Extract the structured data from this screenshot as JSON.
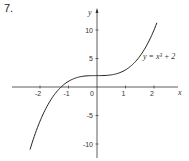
{
  "problem_number": "7.",
  "chart_data": {
    "type": "line",
    "title": "",
    "xlabel": "x",
    "ylabel": "y",
    "xlim": [
      -3.2,
      3.1
    ],
    "ylim": [
      -12.5,
      13.5
    ],
    "x_ticks": [
      -2,
      -1,
      0,
      1,
      2
    ],
    "x_tick_labels": [
      "-2",
      "-1",
      "0",
      "1",
      "2"
    ],
    "y_ticks": [
      10,
      5,
      -5,
      -10
    ],
    "y_tick_labels": [
      "10",
      "5",
      "-5",
      "-10"
    ],
    "grid": false,
    "series": [
      {
        "name": "y = x³ + 2",
        "function": "x^3 + 2",
        "x_range": [
          -2.35,
          2.1
        ],
        "x": [
          -2.35,
          -2,
          -1.5,
          -1.26,
          -1,
          -0.5,
          0,
          0.5,
          1,
          1.5,
          2,
          2.1
        ],
        "values": [
          -10.98,
          -6,
          -1.375,
          0,
          1,
          1.875,
          2,
          2.125,
          3,
          5.375,
          10,
          11.26
        ]
      }
    ],
    "annotations": [
      {
        "text": "y = x³ + 2",
        "x": 1.6,
        "y": 5.3
      }
    ]
  }
}
